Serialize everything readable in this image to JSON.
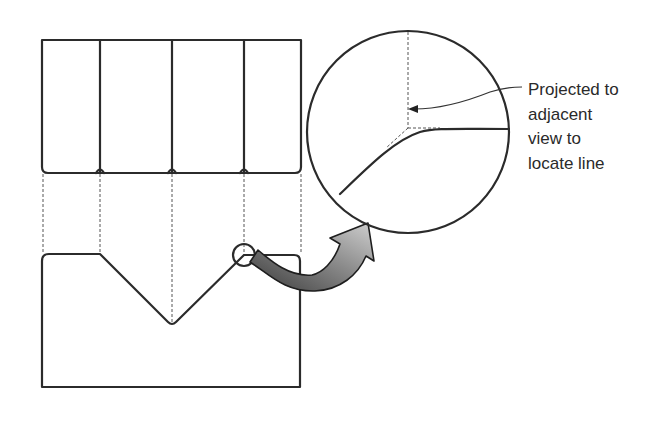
{
  "figure": {
    "callout": {
      "lines": [
        "Projected to",
        "adjacent",
        "view to",
        "locate line"
      ]
    },
    "colors": {
      "line": "#2b2b2b",
      "projection_line": "#555555",
      "arrow_dark": "#3a3a3a",
      "arrow_light": "#c8c8c8"
    },
    "views": {
      "top_view": {
        "name": "top view",
        "segments": 4
      },
      "front_view": {
        "name": "front view",
        "feature": "V-groove"
      },
      "detail_view": {
        "name": "magnified detail circle"
      }
    }
  }
}
